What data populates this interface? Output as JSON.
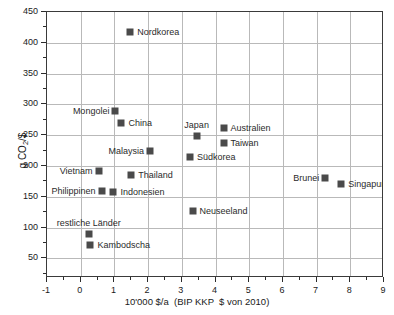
{
  "chart_data": {
    "type": "scatter",
    "title": "",
    "xlabel": "10'000 $/a  (BIP KKP  $ von 2010)",
    "ylabel_text": "g CO",
    "ylabel_sub": "2",
    "ylabel_tail": "/$",
    "xlim": [
      -1,
      9
    ],
    "ylim": [
      18,
      450
    ],
    "grid": true,
    "legend": "none",
    "x_ticks": [
      -1,
      0,
      1,
      2,
      3,
      4,
      5,
      6,
      7,
      8,
      9
    ],
    "x_tick_labels": [
      "-1",
      "0",
      "1",
      "2",
      "3",
      "4",
      "5",
      "6",
      "7",
      "8",
      "9"
    ],
    "y_ticks": [
      50,
      100,
      150,
      200,
      250,
      300,
      350,
      400,
      450
    ],
    "y_tick_labels": [
      "50",
      "100",
      "150",
      "200",
      "250",
      "300",
      "350",
      "400",
      "450"
    ],
    "x_minor_step": 0.5,
    "y_minor_step": 25,
    "marker_color": "#4a4a4a",
    "grid_color": "#b9b9b9",
    "frame_color": "#3a3a3a",
    "points": [
      {
        "label": "Nordkorea",
        "x": 1.47,
        "y": 418,
        "label_pos": "right"
      },
      {
        "label": "Mongolei",
        "x": 1.03,
        "y": 290,
        "label_pos": "left"
      },
      {
        "label": "China",
        "x": 1.21,
        "y": 270,
        "label_pos": "right"
      },
      {
        "label": "Japan",
        "x": 3.44,
        "y": 248,
        "label_pos": "above"
      },
      {
        "label": "Australien",
        "x": 4.24,
        "y": 262,
        "label_pos": "right"
      },
      {
        "label": "Taiwan",
        "x": 4.24,
        "y": 237,
        "label_pos": "right"
      },
      {
        "label": "Malaysia",
        "x": 2.06,
        "y": 224,
        "label_pos": "left"
      },
      {
        "label": "Südkorea",
        "x": 3.24,
        "y": 214,
        "label_pos": "right"
      },
      {
        "label": "Vietnam",
        "x": 0.53,
        "y": 191,
        "label_pos": "left"
      },
      {
        "label": "Thailand",
        "x": 1.5,
        "y": 186,
        "label_pos": "right"
      },
      {
        "label": "Philippinen",
        "x": 0.62,
        "y": 159,
        "label_pos": "left"
      },
      {
        "label": "Indonesien",
        "x": 0.97,
        "y": 157,
        "label_pos": "right"
      },
      {
        "label": "Brunei",
        "x": 7.26,
        "y": 180,
        "label_pos": "left"
      },
      {
        "label": "Singapur",
        "x": 7.73,
        "y": 171,
        "label_pos": "right"
      },
      {
        "label": "Neuseeland",
        "x": 3.32,
        "y": 127,
        "label_pos": "right"
      },
      {
        "label": "restliche Länder",
        "x": 0.24,
        "y": 90,
        "label_pos": "above"
      },
      {
        "label": "Kambodscha",
        "x": 0.29,
        "y": 71,
        "label_pos": "right"
      }
    ]
  }
}
